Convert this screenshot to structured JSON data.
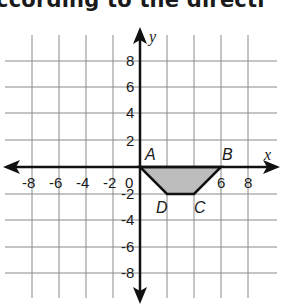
{
  "header": {
    "text": "ccording to the directi"
  },
  "graph": {
    "origin_px": [
      140,
      167
    ],
    "unit_px": 13.5,
    "x_range": [
      -9,
      10
    ],
    "y_range": [
      -9,
      10
    ],
    "gridline_step": 2,
    "colors": {
      "grid": "#8a8a8a",
      "axis": "#111111",
      "shape_fill": "#bdbdbd",
      "shape_stroke": "#111111"
    },
    "axes": {
      "x_label": "x",
      "y_label": "y"
    },
    "x_ticks": [
      {
        "value": -8,
        "label": "-8"
      },
      {
        "value": -6,
        "label": "-6"
      },
      {
        "value": -4,
        "label": "-4"
      },
      {
        "value": -2,
        "label": "-2"
      },
      {
        "value": 0,
        "label": "0"
      },
      {
        "value": 6,
        "label": "6"
      },
      {
        "value": 8,
        "label": "8"
      }
    ],
    "y_ticks": [
      {
        "value": 8,
        "label": "8"
      },
      {
        "value": 6,
        "label": "6"
      },
      {
        "value": 4,
        "label": "4"
      },
      {
        "value": 2,
        "label": "2"
      },
      {
        "value": -2,
        "label": "-2"
      },
      {
        "value": -4,
        "label": "-4"
      },
      {
        "value": -6,
        "label": "-6"
      },
      {
        "value": -8,
        "label": "-8"
      }
    ],
    "shape": {
      "name": "ABCD",
      "vertices": [
        {
          "label": "A",
          "x": 0,
          "y": 0
        },
        {
          "label": "B",
          "x": 6,
          "y": 0
        },
        {
          "label": "C",
          "x": 4,
          "y": -2
        },
        {
          "label": "D",
          "x": 2,
          "y": -2
        }
      ]
    }
  }
}
